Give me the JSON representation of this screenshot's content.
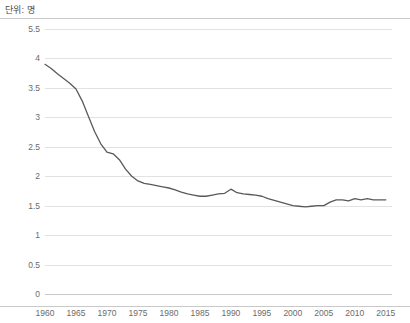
{
  "unit_label": "단위: 명",
  "colors": {
    "line": "#595959",
    "gridline": "#e2e2e2",
    "rule": "#c9c9c9",
    "tick_text": "#6b6b6b",
    "unit_text": "#4a4a4a",
    "background": "#ffffff"
  },
  "chart_data": {
    "type": "line",
    "title": "",
    "subtitle": "",
    "xlabel": "",
    "ylabel": "단위: 명",
    "grid": true,
    "legend": false,
    "xlim": [
      1960,
      2016
    ],
    "ylim": [
      0,
      5.5
    ],
    "ytick_labels": [
      "5.5",
      "4",
      "3.5",
      "3",
      "2.5",
      "2",
      "1.5",
      "1",
      "0.5",
      "0"
    ],
    "ytick_values": [
      5.5,
      4,
      3.5,
      3,
      2.5,
      2,
      1.5,
      1,
      0.5,
      0
    ],
    "xtick_labels": [
      "1960",
      "1965",
      "1970",
      "1975",
      "1980",
      "1985",
      "1990",
      "1995",
      "2000",
      "2005",
      "2010",
      "2015"
    ],
    "xtick_values": [
      1960,
      1965,
      1970,
      1975,
      1980,
      1985,
      1990,
      1995,
      2000,
      2005,
      2010,
      2015
    ],
    "series": [
      {
        "name": "합계출산율",
        "x": [
          1960,
          1961,
          1962,
          1963,
          1964,
          1965,
          1966,
          1967,
          1968,
          1969,
          1970,
          1971,
          1972,
          1973,
          1974,
          1975,
          1976,
          1977,
          1978,
          1979,
          1980,
          1981,
          1982,
          1983,
          1984,
          1985,
          1986,
          1987,
          1988,
          1989,
          1990,
          1991,
          1992,
          1993,
          1994,
          1995,
          1996,
          1997,
          1998,
          1999,
          2000,
          2001,
          2002,
          2003,
          2004,
          2005,
          2006,
          2007,
          2008,
          2009,
          2010,
          2011,
          2012,
          2013,
          2014,
          2015
        ],
        "values": [
          3.9,
          3.83,
          3.74,
          3.66,
          3.58,
          3.48,
          3.28,
          3.02,
          2.76,
          2.55,
          2.41,
          2.38,
          2.28,
          2.12,
          2.0,
          1.92,
          1.88,
          1.86,
          1.84,
          1.82,
          1.8,
          1.77,
          1.73,
          1.7,
          1.68,
          1.66,
          1.66,
          1.68,
          1.7,
          1.71,
          1.78,
          1.72,
          1.7,
          1.69,
          1.68,
          1.66,
          1.62,
          1.59,
          1.56,
          1.53,
          1.5,
          1.49,
          1.48,
          1.49,
          1.5,
          1.5,
          1.56,
          1.6,
          1.6,
          1.58,
          1.62,
          1.6,
          1.62,
          1.6,
          1.6,
          1.6
        ]
      }
    ]
  }
}
